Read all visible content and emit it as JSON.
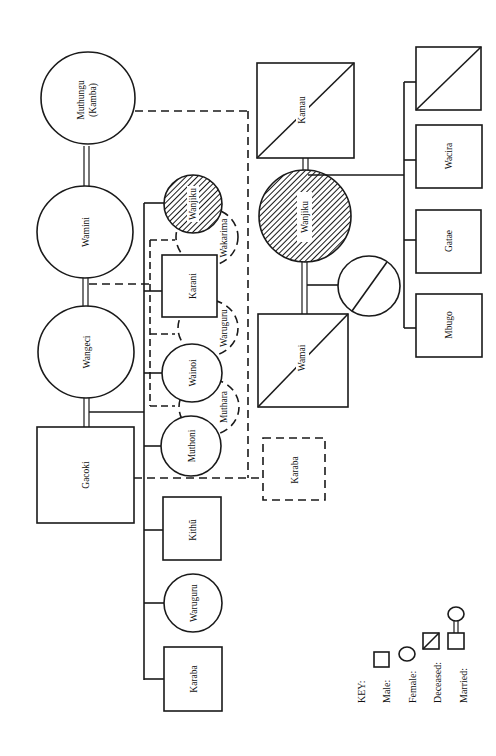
{
  "diagram": {
    "type": "kinship-genealogy",
    "orientation": "rotated-90-ccw",
    "colors": {
      "line": "#1a1a1a",
      "background": "#ffffff"
    }
  },
  "people": {
    "muthungu": {
      "label": "Muthungu",
      "label2": "(Kamba)",
      "sex": "female"
    },
    "wamini": {
      "label": "Wamini",
      "sex": "female"
    },
    "wangeci": {
      "label": "Wangeci",
      "sex": "female"
    },
    "gacoki": {
      "label": "Gacoki",
      "sex": "male"
    },
    "wanjiku_a": {
      "label": "Wanjiku",
      "sex": "female",
      "hatched": true
    },
    "wakarima": {
      "label": "Wakarima",
      "sex": "female",
      "dashed": true
    },
    "karani": {
      "label": "Karani",
      "sex": "male"
    },
    "waruguru_a": {
      "label": "Waruguru",
      "sex": "female",
      "dashed": true
    },
    "wainoi": {
      "label": "Wainoi",
      "sex": "female"
    },
    "muthara": {
      "label": "Muthara",
      "sex": "female",
      "dashed": true
    },
    "muthoni": {
      "label": "Muthoni",
      "sex": "female"
    },
    "kithu": {
      "label": "Kithũ",
      "sex": "male"
    },
    "waruguru_b": {
      "label": "Waruguru",
      "sex": "female"
    },
    "karaba_a": {
      "label": "Karaba",
      "sex": "male"
    },
    "karaba_b": {
      "label": "Karaba",
      "sex": "male",
      "dashed": true
    },
    "kamau": {
      "label": "Kamau",
      "sex": "male",
      "deceased": true
    },
    "wanjiku_b": {
      "label": "Wanjiku",
      "sex": "female",
      "hatched": true
    },
    "wamai": {
      "label": "Wamai",
      "sex": "male",
      "deceased": true
    },
    "unnamed_female": {
      "label": "",
      "sex": "female",
      "deceased": true
    },
    "unnamed_male": {
      "label": "",
      "sex": "male",
      "deceased": true
    },
    "wacira": {
      "label": "Wacira",
      "sex": "male"
    },
    "gatae": {
      "label": "Gatae",
      "sex": "male"
    },
    "mbugo": {
      "label": "Mbugo",
      "sex": "male"
    }
  },
  "key": {
    "title": "KEY:",
    "male": "Male:",
    "female": "Female:",
    "deceased": "Deceased:",
    "married": "Married:"
  }
}
